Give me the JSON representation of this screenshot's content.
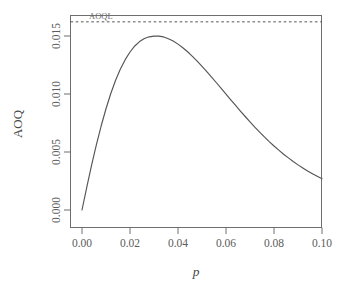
{
  "chart_data": {
    "type": "line",
    "title": "",
    "xlabel": "p",
    "ylabel": "AOQ",
    "xlim": [
      0.0,
      0.104
    ],
    "ylim": [
      -0.0005,
      0.0175
    ],
    "grid": false,
    "legend": null,
    "x_ticks": [
      0.0,
      0.02,
      0.04,
      0.06,
      0.08,
      0.1
    ],
    "x_tick_labels": [
      "0.00",
      "0.02",
      "0.04",
      "0.06",
      "0.08",
      "0.10"
    ],
    "y_ticks": [
      0.0,
      0.005,
      0.01,
      0.015
    ],
    "y_tick_labels": [
      "0.000",
      "0.005",
      "0.010",
      "0.015"
    ],
    "annotations": [
      {
        "name": "aoql-label",
        "text": "AOQL",
        "x": 0.0025,
        "y": 0.0162,
        "kind": "text"
      },
      {
        "name": "aoql-line",
        "text": "",
        "y": 0.01622,
        "kind": "hline-dashed",
        "color": "#555555"
      }
    ],
    "series": [
      {
        "name": "AOQ",
        "color": "#555555",
        "style": "solid",
        "x": [
          0.0,
          0.002,
          0.004,
          0.006,
          0.008,
          0.01,
          0.012,
          0.014,
          0.016,
          0.018,
          0.02,
          0.022,
          0.024,
          0.026,
          0.028,
          0.03,
          0.031,
          0.032,
          0.034,
          0.036,
          0.038,
          0.04,
          0.042,
          0.044,
          0.046,
          0.048,
          0.05,
          0.052,
          0.054,
          0.056,
          0.058,
          0.06,
          0.062,
          0.064,
          0.066,
          0.068,
          0.07,
          0.072,
          0.074,
          0.076,
          0.078,
          0.08,
          0.082,
          0.084,
          0.086,
          0.088,
          0.09,
          0.092,
          0.094,
          0.096,
          0.098,
          0.1
        ],
        "y": [
          0.0,
          0.00197,
          0.00386,
          0.00563,
          0.00726,
          0.00873,
          0.01004,
          0.01118,
          0.01215,
          0.01296,
          0.01362,
          0.01414,
          0.01452,
          0.01478,
          0.01493,
          0.01499,
          0.015,
          0.01499,
          0.01492,
          0.01477,
          0.01457,
          0.0143,
          0.01399,
          0.01364,
          0.01325,
          0.01283,
          0.01239,
          0.01193,
          0.01146,
          0.01097,
          0.01048,
          0.00999,
          0.0095,
          0.00901,
          0.00853,
          0.00806,
          0.0076,
          0.00715,
          0.00672,
          0.0063,
          0.0059,
          0.00552,
          0.00516,
          0.00481,
          0.00449,
          0.00418,
          0.00389,
          0.00362,
          0.00336,
          0.00313,
          0.00291,
          0.0027
        ]
      }
    ],
    "peak": {
      "x": 0.031,
      "y": 0.015
    },
    "endpoint": {
      "x": 0.1,
      "y": 0.0033
    }
  },
  "axes": {
    "y_axis_title": "AOQ",
    "x_axis_title": "p"
  },
  "colors": {
    "curve": "#555555",
    "aoql_line": "#555555",
    "frame": "#6e6e6e",
    "tick_text": "#5c5c5c"
  }
}
